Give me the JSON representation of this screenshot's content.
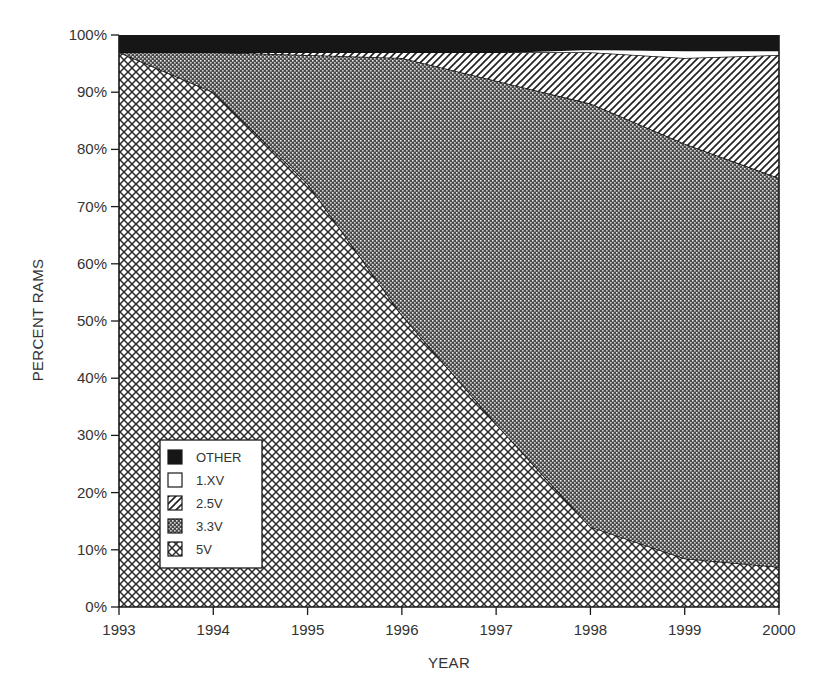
{
  "chart_data": {
    "type": "area",
    "stacked": true,
    "normalized_percent": true,
    "title": "",
    "xlabel": "YEAR",
    "ylabel": "PERCENT RAMS",
    "x": [
      1993,
      1994,
      1995,
      1996,
      1997,
      1998,
      1999,
      2000
    ],
    "xlim": [
      1993,
      2000
    ],
    "ylim": [
      0,
      100
    ],
    "y_ticks": [
      "0%",
      "10%",
      "20%",
      "30%",
      "40%",
      "50%",
      "60%",
      "70%",
      "80%",
      "90%",
      "100%"
    ],
    "x_ticks": [
      "1993",
      "1994",
      "1995",
      "1996",
      "1997",
      "1998",
      "1999",
      "2000"
    ],
    "grid": false,
    "legend_position": "lower-left inside plot",
    "series": [
      {
        "name": "5V",
        "pattern": "crosshatch",
        "values": [
          97,
          90,
          74,
          51,
          32,
          14,
          8.5,
          7
        ]
      },
      {
        "name": "3.3V",
        "pattern": "stipple",
        "values": [
          0,
          7,
          22.5,
          45,
          60,
          74,
          72.5,
          68
        ]
      },
      {
        "name": "2.5V",
        "pattern": "diagonal",
        "values": [
          0,
          0,
          0.5,
          1,
          5,
          9,
          15,
          21.5
        ]
      },
      {
        "name": "1.XV",
        "pattern": "blank",
        "values": [
          0,
          0,
          0,
          0,
          0,
          0.5,
          0.7,
          0.8
        ]
      },
      {
        "name": "OTHER",
        "pattern": "solid-black",
        "values": [
          3,
          3,
          3,
          3,
          3,
          2.5,
          3.3,
          2.7
        ]
      }
    ],
    "cumulative_tops": {
      "5V": [
        97,
        90,
        74,
        51,
        32,
        14,
        8.5,
        7
      ],
      "3.3V": [
        97,
        97,
        96.5,
        96,
        92,
        88,
        81,
        75
      ],
      "2.5V": [
        97,
        97,
        97,
        97,
        97,
        97,
        96,
        96.5
      ],
      "1.XV": [
        97,
        97,
        97,
        97,
        97,
        97.5,
        97.3,
        97.3
      ],
      "OTHER": [
        100,
        100,
        100,
        100,
        100,
        100,
        100,
        100
      ]
    }
  },
  "legend": {
    "items": [
      {
        "label": "OTHER",
        "pattern": "solid-black"
      },
      {
        "label": "1.XV",
        "pattern": "blank"
      },
      {
        "label": "2.5V",
        "pattern": "diagonal"
      },
      {
        "label": "3.3V",
        "pattern": "stipple"
      },
      {
        "label": "5V",
        "pattern": "crosshatch"
      }
    ]
  },
  "axes": {
    "x_title": "YEAR",
    "y_title": "PERCENT RAMS",
    "y_labels": [
      "0%",
      "10%",
      "20%",
      "30%",
      "40%",
      "50%",
      "60%",
      "70%",
      "80%",
      "90%",
      "100%"
    ],
    "x_labels": [
      "1993",
      "1994",
      "1995",
      "1996",
      "1997",
      "1998",
      "1999",
      "2000"
    ]
  },
  "colors": {
    "ink": "#1a1a1a",
    "paper": "#ffffff",
    "label": "#333333"
  }
}
